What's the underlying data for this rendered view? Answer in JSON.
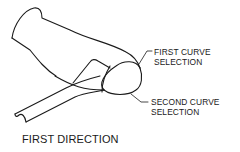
{
  "diagram": {
    "type": "CAD surface sketch",
    "labels": {
      "first_curve": {
        "line1": "FIRST CURVE",
        "line2": "SELECTION"
      },
      "second_curve": {
        "line1": "SECOND CURVE",
        "line2": "SELECTION"
      },
      "caption": "FIRST DIRECTION"
    },
    "colors": {
      "stroke": "#1a1a1a",
      "background": "#ffffff"
    }
  }
}
